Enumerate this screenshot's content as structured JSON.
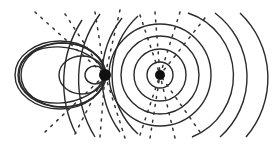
{
  "diagram": {
    "title": "Field lines and wavefronts around two point sources",
    "background": "#ffffff",
    "line_color": "#2a2a2a",
    "sources": [
      {
        "name": "left-source",
        "cx": 105,
        "cy": 75,
        "r": 6
      },
      {
        "name": "right-source",
        "cx": 160,
        "cy": 75,
        "r": 5
      }
    ],
    "right_circles_radii": [
      13,
      26,
      39,
      51
    ],
    "left_loops": [
      {
        "rx": 10,
        "ry": 9
      },
      {
        "rx": 24,
        "ry": 20
      },
      {
        "rx": 44,
        "ry": 32
      },
      {
        "rx": 64,
        "ry": 35
      },
      {
        "rx": 87,
        "ry": 40
      }
    ],
    "outer_arcs_right": [
      185,
      220,
      262
    ],
    "labels": []
  }
}
